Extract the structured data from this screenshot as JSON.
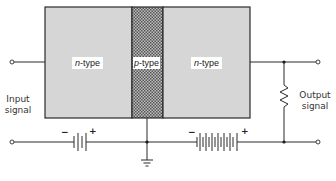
{
  "diagram": {
    "regions": [
      {
        "id": "emitter",
        "prefix": "n",
        "suffix": "-type",
        "fill": "#d6d6d6"
      },
      {
        "id": "base",
        "prefix": "p",
        "suffix": "-type",
        "fill": "hatched"
      },
      {
        "id": "collector",
        "prefix": "n",
        "suffix": "-type",
        "fill": "#d6d6d6"
      }
    ],
    "labels": {
      "input_line1": "Input",
      "input_line2": "signal",
      "output_line1": "Output",
      "output_line2": "signal"
    },
    "batteries": {
      "emitter_battery": {
        "neg": "−",
        "pos": "+",
        "cells": 2
      },
      "collector_battery": {
        "neg": "−",
        "pos": "+",
        "cells": 6
      }
    },
    "components": [
      "resistor",
      "ground"
    ],
    "colors": {
      "line": "#2a2a2a",
      "region": "#d6d6d6",
      "hatch_dark": "#555555",
      "hatch_light": "#bdbdbd"
    }
  }
}
